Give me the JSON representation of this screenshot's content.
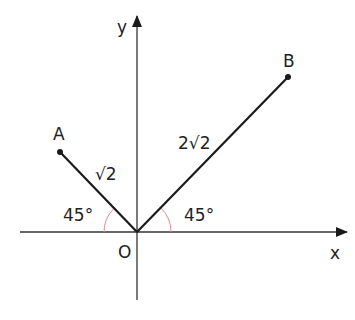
{
  "diagram": {
    "axes": {
      "x_label": "x",
      "y_label": "y",
      "origin_label": "O"
    },
    "points": [
      {
        "label": "A"
      },
      {
        "label": "B"
      }
    ],
    "segments": [
      {
        "from": "O",
        "to": "A",
        "length_label": "√2"
      },
      {
        "from": "O",
        "to": "B",
        "length_label": "2√2"
      }
    ],
    "angles": [
      {
        "label": "45°",
        "between": "OA and negative x-axis"
      },
      {
        "label": "45°",
        "between": "OB and positive x-axis"
      }
    ],
    "colors": {
      "line": "#1a1a1a",
      "axis": "#333333",
      "arc": "#e8889a"
    }
  }
}
